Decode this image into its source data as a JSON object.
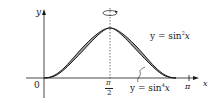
{
  "axes": {
    "x_label": "x",
    "y_label": "y",
    "origin_label": "0"
  },
  "ticks": {
    "pi_over_2_num": "π",
    "pi_over_2_den": "2",
    "pi": "π"
  },
  "curves": {
    "upper": {
      "prefix": "y = sin",
      "exp": "2",
      "var": "x"
    },
    "lower": {
      "prefix": "y = sin",
      "exp": "4",
      "var": "x"
    }
  },
  "colors": {
    "shade": "#a0a0a0",
    "line": "#1a1a1a"
  }
}
